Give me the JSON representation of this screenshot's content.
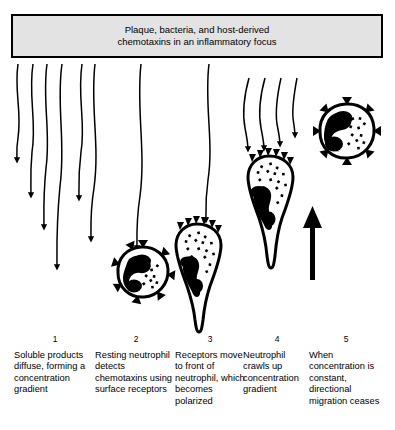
{
  "figure": {
    "header": {
      "line1": "Plaque, bacteria, and host-derived",
      "line2": "chemotaxins in an inflammatory focus"
    },
    "steps": [
      {
        "number": "1",
        "text": "Soluble products diffuse, forming a concentration gradient",
        "element": "wavy-diffusion-arrows"
      },
      {
        "number": "2",
        "text": "Resting neutrophil detects chemotaxins using surface receptors",
        "element": "round-neutrophil"
      },
      {
        "number": "3",
        "text": "Receptors move to front of neutrophil, which becomes polarized",
        "element": "polarized-neutrophil"
      },
      {
        "number": "4",
        "text": "Neutrophil crawls up concentration gradient",
        "element": "migrating-neutrophil-with-arrow"
      },
      {
        "number": "5",
        "text": "When concentration is constant, directional migration ceases",
        "element": "round-neutrophil-uniform-receptors"
      }
    ],
    "colors": {
      "ink": "#000000",
      "banner_fill": "#e3e3e3",
      "background": "#ffffff"
    }
  }
}
